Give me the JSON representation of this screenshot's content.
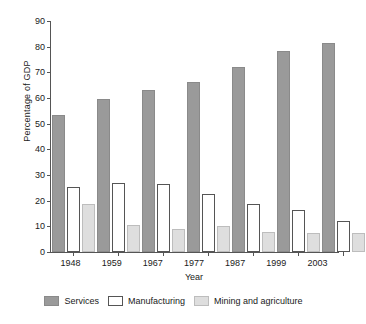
{
  "chart_data": {
    "type": "bar",
    "title": "",
    "xlabel": "Year",
    "ylabel": "Percentage of GDP",
    "categories": [
      "1948",
      "1959",
      "1967",
      "1977",
      "1987",
      "1999",
      "2003"
    ],
    "series": [
      {
        "name": "Services",
        "color": "#9a9a9a",
        "values": [
          53.2,
          59.5,
          63.0,
          66.4,
          72.0,
          78.2,
          81.4
        ]
      },
      {
        "name": "Manufacturing",
        "color": "#ffffff",
        "values": [
          25.3,
          27.0,
          26.5,
          22.6,
          18.8,
          16.4,
          12.0
        ]
      },
      {
        "name": "Mining and agriculture",
        "color": "#dedede",
        "values": [
          18.6,
          10.5,
          8.9,
          10.0,
          7.8,
          7.4,
          7.3
        ]
      }
    ],
    "ylim": [
      0,
      90
    ],
    "y_ticks": [
      0,
      10,
      20,
      30,
      40,
      50,
      60,
      70,
      80,
      90
    ],
    "grid": false,
    "legend_position": "bottom"
  }
}
